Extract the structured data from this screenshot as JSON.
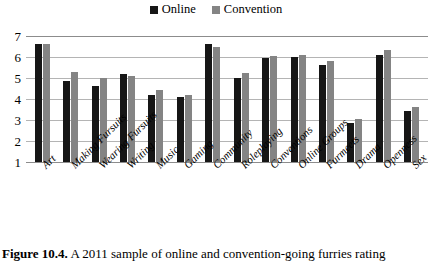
{
  "legend": {
    "position": "top-center",
    "entries": [
      {
        "label": "Online",
        "color": "#161616",
        "key": "online"
      },
      {
        "label": "Convention",
        "color": "#848484",
        "key": "convention"
      }
    ]
  },
  "caption": {
    "figure_number": "Figure 10.4.",
    "text": " A 2011 sample of online and convention-going furries rating"
  },
  "chart_data": {
    "type": "bar",
    "title": "",
    "xlabel": "",
    "ylabel": "",
    "ylim": [
      1,
      7
    ],
    "yticks": [
      7,
      6,
      5,
      4,
      3,
      2,
      1
    ],
    "grid": true,
    "legend_position": "top-center",
    "categories": [
      "Art",
      "Making Fursuits",
      "Wearing Fursuits",
      "Writing",
      "Music",
      "Gaming",
      "Community",
      "Roleplaying",
      "Conventions",
      "Online Groups",
      "Furmeets",
      "Drama",
      "Openness",
      "Sex"
    ],
    "series": [
      {
        "name": "Online",
        "color": "#161616",
        "values": [
          6.6,
          4.85,
          4.6,
          5.2,
          4.2,
          4.1,
          6.6,
          5.0,
          5.95,
          6.0,
          5.6,
          2.85,
          6.1,
          3.45
        ]
      },
      {
        "name": "Convention",
        "color": "#848484",
        "values": [
          6.6,
          5.3,
          5.0,
          5.1,
          4.45,
          4.2,
          6.5,
          5.25,
          6.05,
          6.1,
          5.8,
          3.05,
          6.35,
          3.6
        ]
      }
    ]
  }
}
